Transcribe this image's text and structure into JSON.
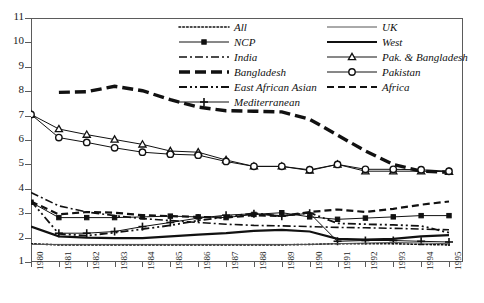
{
  "chart_data": {
    "type": "line",
    "title": "",
    "xlabel": "",
    "ylabel": "",
    "x": [
      1980,
      1981,
      1982,
      1983,
      1984,
      1985,
      1986,
      1987,
      1988,
      1989,
      1990,
      1991,
      1992,
      1993,
      1994,
      1995
    ],
    "xtick_labels": [
      "1980",
      "1981",
      "1982",
      "1983",
      "1984",
      "1985",
      "1986",
      "1987",
      "1988",
      "1989",
      "1990",
      "1991",
      "1992",
      "1993",
      "1994",
      "1995"
    ],
    "ytick_labels": [
      "1",
      "2",
      "3",
      "4",
      "5",
      "6",
      "7",
      "8",
      "9",
      "10",
      "11"
    ],
    "ylim": [
      1,
      11
    ],
    "xlim": [
      1980,
      1995
    ],
    "grid": false,
    "legend_position": "top-right",
    "series": [
      {
        "name": "All",
        "style": "dotted",
        "marker": "none",
        "width": 1.6,
        "color": "#111111",
        "values": [
          1.75,
          1.7,
          1.7,
          1.7,
          1.7,
          1.7,
          1.7,
          1.7,
          1.7,
          1.7,
          1.72,
          1.75,
          1.75,
          1.75,
          1.72,
          1.7
        ]
      },
      {
        "name": "NCP",
        "style": "solid",
        "marker": "square",
        "width": 1,
        "color": "#111111",
        "values": [
          3.45,
          2.82,
          2.82,
          2.82,
          2.85,
          2.88,
          2.85,
          2.82,
          2.95,
          3.02,
          2.85,
          2.75,
          2.8,
          2.85,
          2.9,
          2.9
        ]
      },
      {
        "name": "India",
        "style": "dashdot",
        "marker": "none",
        "width": 1.6,
        "color": "#111111",
        "values": [
          3.85,
          3.3,
          3.05,
          2.9,
          2.78,
          2.7,
          2.62,
          2.55,
          2.5,
          2.48,
          2.45,
          2.42,
          2.4,
          2.38,
          2.35,
          2.32
        ]
      },
      {
        "name": "Bangladesh",
        "style": "thick-dash",
        "marker": "none",
        "width": 3.4,
        "color": "#111111",
        "values": [
          null,
          7.95,
          7.98,
          8.2,
          8.02,
          7.65,
          7.35,
          7.2,
          7.18,
          7.15,
          6.85,
          6.2,
          5.55,
          5.0,
          4.72,
          4.68
        ]
      },
      {
        "name": "East African Asian",
        "style": "dashdotdot",
        "marker": "none",
        "width": 1.8,
        "color": "#111111",
        "values": [
          3.5,
          2.15,
          2.08,
          2.2,
          2.35,
          2.5,
          2.7,
          2.85,
          3.0,
          2.88,
          3.02,
          2.58,
          2.55,
          2.52,
          2.48,
          2.2
        ]
      },
      {
        "name": "Mediterranean",
        "style": "solid",
        "marker": "plus",
        "width": 1,
        "color": "#111111",
        "values": [
          null,
          2.18,
          2.18,
          2.25,
          2.45,
          2.62,
          2.8,
          2.92,
          2.98,
          2.88,
          3.0,
          1.85,
          1.88,
          1.88,
          1.85,
          1.82
        ]
      },
      {
        "name": "UK",
        "style": "solid",
        "marker": "none",
        "width": 1,
        "color": "#555555",
        "values": [
          1.72,
          1.72,
          1.72,
          1.72,
          1.72,
          1.72,
          1.72,
          1.72,
          1.72,
          1.72,
          1.72,
          1.75,
          1.78,
          1.8,
          1.78,
          1.75
        ]
      },
      {
        "name": "West",
        "style": "solid",
        "marker": "none",
        "width": 2.2,
        "color": "#111111",
        "values": [
          2.45,
          2.05,
          2.0,
          1.98,
          1.98,
          2.05,
          2.12,
          2.18,
          2.28,
          2.32,
          2.25,
          1.95,
          1.92,
          1.95,
          2.05,
          2.1
        ]
      },
      {
        "name": "Pak. & Bangladesh",
        "style": "solid",
        "marker": "triangle",
        "width": 1,
        "color": "#111111",
        "values": [
          7.05,
          6.45,
          6.22,
          6.02,
          5.82,
          5.55,
          5.5,
          5.18,
          4.92,
          4.92,
          4.75,
          5.0,
          4.72,
          4.72,
          4.72,
          4.7
        ]
      },
      {
        "name": "Pakistan",
        "style": "solid",
        "marker": "circle",
        "width": 1,
        "color": "#111111",
        "values": [
          7.05,
          6.1,
          5.9,
          5.68,
          5.5,
          5.42,
          5.38,
          5.12,
          4.92,
          4.92,
          4.78,
          5.0,
          4.8,
          4.8,
          4.78,
          4.72
        ]
      },
      {
        "name": "Africa",
        "style": "dash",
        "marker": "none",
        "width": 2.2,
        "color": "#111111",
        "values": [
          3.48,
          2.95,
          3.05,
          3.02,
          2.92,
          2.88,
          2.85,
          2.82,
          2.92,
          2.88,
          3.05,
          3.15,
          3.05,
          3.18,
          3.35,
          3.48
        ]
      }
    ]
  },
  "legend": {
    "left_column": [
      "All",
      "NCP",
      "India",
      "Bangladesh",
      "East African Asian",
      "Mediterranean"
    ],
    "right_column": [
      "UK",
      "West",
      "Pak. & Bangladesh",
      "Pakistan",
      "Africa"
    ]
  }
}
